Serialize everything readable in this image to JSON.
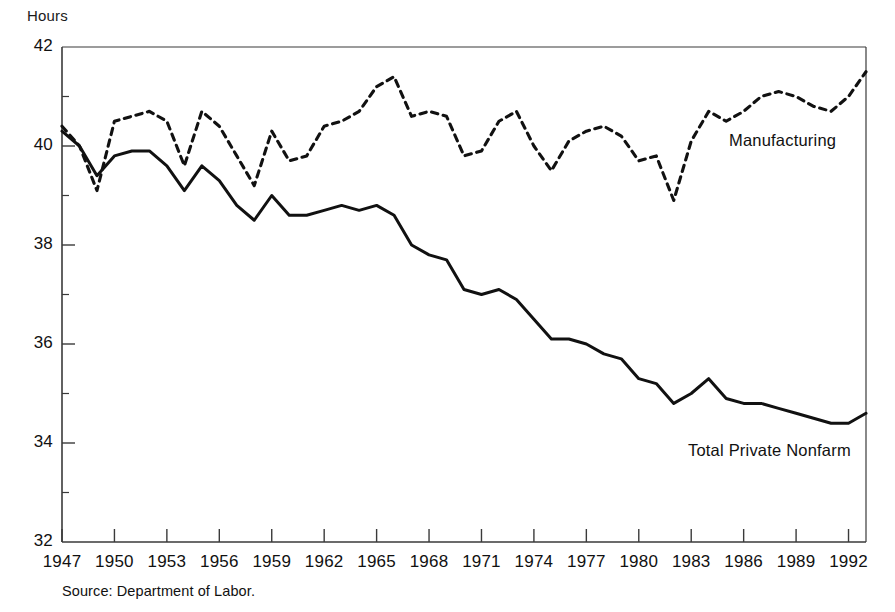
{
  "chart_data": {
    "type": "line",
    "title": "",
    "xlabel": "",
    "ylabel": "Hours",
    "xlim": [
      1947,
      1993
    ],
    "ylim": [
      32,
      42
    ],
    "grid": false,
    "legend_position": "inline-annotations",
    "y_ticks": [
      32,
      34,
      36,
      38,
      40,
      42
    ],
    "y_minor_ticks": [
      33,
      35,
      37,
      39,
      41
    ],
    "x_ticks": [
      1947,
      1950,
      1953,
      1956,
      1959,
      1962,
      1965,
      1968,
      1971,
      1974,
      1977,
      1980,
      1983,
      1986,
      1989,
      1992
    ],
    "x_minor_ticks": [
      1948,
      1949,
      1951,
      1952,
      1954,
      1955,
      1957,
      1958,
      1960,
      1961,
      1963,
      1964,
      1966,
      1967,
      1969,
      1970,
      1972,
      1973,
      1975,
      1976,
      1978,
      1979,
      1981,
      1982,
      1984,
      1985,
      1987,
      1988,
      1990,
      1991,
      1993
    ],
    "x": [
      1947,
      1948,
      1949,
      1950,
      1951,
      1952,
      1953,
      1954,
      1955,
      1956,
      1957,
      1958,
      1959,
      1960,
      1961,
      1962,
      1963,
      1964,
      1965,
      1966,
      1967,
      1968,
      1969,
      1970,
      1971,
      1972,
      1973,
      1974,
      1975,
      1976,
      1977,
      1978,
      1979,
      1980,
      1981,
      1982,
      1983,
      1984,
      1985,
      1986,
      1987,
      1988,
      1989,
      1990,
      1991,
      1992,
      1993
    ],
    "series": [
      {
        "name": "Manufacturing",
        "style": "dashed",
        "color": "#111111",
        "values": [
          40.4,
          40.0,
          39.1,
          40.5,
          40.6,
          40.7,
          40.5,
          39.6,
          40.7,
          40.4,
          39.8,
          39.2,
          40.3,
          39.7,
          39.8,
          40.4,
          40.5,
          40.7,
          41.2,
          41.4,
          40.6,
          40.7,
          40.6,
          39.8,
          39.9,
          40.5,
          40.7,
          40.0,
          39.5,
          40.1,
          40.3,
          40.4,
          40.2,
          39.7,
          39.8,
          38.9,
          40.1,
          40.7,
          40.5,
          40.7,
          41.0,
          41.1,
          41.0,
          40.8,
          40.7,
          41.0,
          41.5
        ]
      },
      {
        "name": "Total Private Nonfarm",
        "style": "solid",
        "color": "#111111",
        "values": [
          40.3,
          40.0,
          39.4,
          39.8,
          39.9,
          39.9,
          39.6,
          39.1,
          39.6,
          39.3,
          38.8,
          38.5,
          39.0,
          38.6,
          38.6,
          38.7,
          38.8,
          38.7,
          38.8,
          38.6,
          38.0,
          37.8,
          37.7,
          37.1,
          37.0,
          37.1,
          36.9,
          36.5,
          36.1,
          36.1,
          36.0,
          35.8,
          35.7,
          35.3,
          35.2,
          34.8,
          35.0,
          35.3,
          34.9,
          34.8,
          34.8,
          34.7,
          34.6,
          34.5,
          34.4,
          34.4,
          34.6
        ]
      }
    ],
    "annotations": [
      {
        "text": "Manufacturing",
        "x": 1986,
        "y": 40.2
      },
      {
        "text": "Total Private Nonfarm",
        "x": 1984,
        "y": 33.8
      }
    ],
    "source": "Source: Department of Labor."
  },
  "axis": {
    "y_title": "Hours",
    "y_tick_labels": [
      "42",
      "40",
      "38",
      "36",
      "34",
      "32"
    ],
    "x_tick_labels": [
      "1947",
      "1950",
      "1953",
      "1956",
      "1959",
      "1962",
      "1965",
      "1968",
      "1971",
      "1974",
      "1977",
      "1980",
      "1983",
      "1986",
      "1989",
      "1992"
    ]
  },
  "labels": {
    "manufacturing": "Manufacturing",
    "total_private_nonfarm": "Total Private Nonfarm"
  },
  "footer": {
    "source": "Source: Department of Labor."
  }
}
